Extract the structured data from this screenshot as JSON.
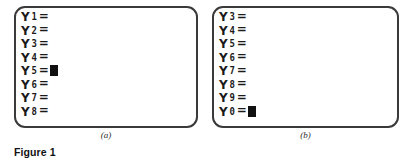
{
  "figure": {
    "label": "Figure 1"
  },
  "panels": [
    {
      "id": "a",
      "caption": "(a)",
      "cursor_row_index": 4,
      "rows": [
        {
          "var": "Y",
          "index": "1",
          "equals": "=",
          "value": ""
        },
        {
          "var": "Y",
          "index": "2",
          "equals": "=",
          "value": ""
        },
        {
          "var": "Y",
          "index": "3",
          "equals": "=",
          "value": ""
        },
        {
          "var": "Y",
          "index": "4",
          "equals": "=",
          "value": ""
        },
        {
          "var": "Y",
          "index": "5",
          "equals": "=",
          "value": ""
        },
        {
          "var": "Y",
          "index": "6",
          "equals": "=",
          "value": ""
        },
        {
          "var": "Y",
          "index": "7",
          "equals": "=",
          "value": ""
        },
        {
          "var": "Y",
          "index": "8",
          "equals": "=",
          "value": ""
        }
      ]
    },
    {
      "id": "b",
      "caption": "(b)",
      "cursor_row_index": 7,
      "rows": [
        {
          "var": "Y",
          "index": "3",
          "equals": "=",
          "value": ""
        },
        {
          "var": "Y",
          "index": "4",
          "equals": "=",
          "value": ""
        },
        {
          "var": "Y",
          "index": "5",
          "equals": "=",
          "value": ""
        },
        {
          "var": "Y",
          "index": "6",
          "equals": "=",
          "value": ""
        },
        {
          "var": "Y",
          "index": "7",
          "equals": "=",
          "value": ""
        },
        {
          "var": "Y",
          "index": "8",
          "equals": "=",
          "value": ""
        },
        {
          "var": "Y",
          "index": "9",
          "equals": "=",
          "value": ""
        },
        {
          "var": "Y",
          "index": "0",
          "equals": "=",
          "value": ""
        }
      ]
    }
  ],
  "colors": {
    "screen_border": "#3a3a3a",
    "screen_background": "#ffffff",
    "text": "#1a1a1a",
    "cursor": "#111111"
  }
}
